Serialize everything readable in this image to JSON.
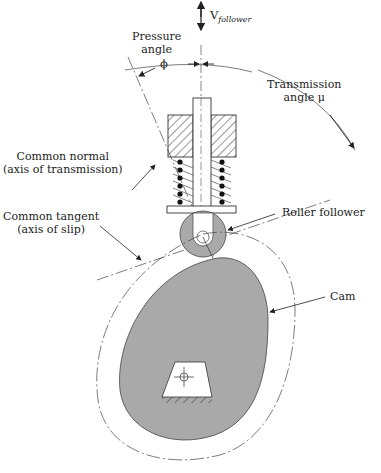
{
  "diagram": {
    "type": "cam-and-roller-follower",
    "labels": {
      "velocity": "V",
      "velocity_subscript": "follower",
      "pressure_angle_line1": "Pressure",
      "pressure_angle_line2": "angle",
      "phi": "ϕ",
      "transmission_line1": "Transmission",
      "transmission_line2": "angle  μ",
      "common_normal_line1": "Common normal",
      "common_normal_line2": "(axis of transmission)",
      "common_tangent_line1": "Common tangent",
      "common_tangent_line2": "(axis of slip)",
      "roller_follower": "Roller follower",
      "cam": "Cam"
    },
    "colors": {
      "cam_fill": "#a9a9a9",
      "roller_fill": "#a9a9a9",
      "line": "#333333",
      "background": "#ffffff"
    }
  }
}
